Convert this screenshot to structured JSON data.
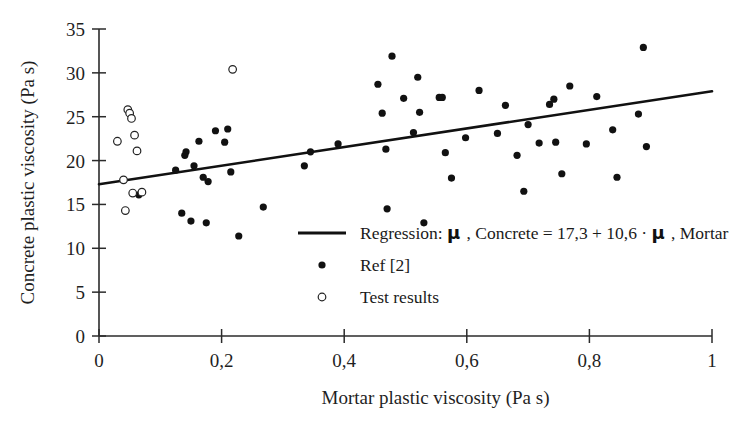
{
  "chart_data": {
    "type": "scatter",
    "title": "",
    "xlabel": "Mortar plastic viscosity (Pa s)",
    "ylabel": "Concrete plastic viscosity (Pa s)",
    "xlim": [
      0,
      1
    ],
    "ylim": [
      0,
      35
    ],
    "xticks": [
      "0",
      "0,2",
      "0,4",
      "0,6",
      "0,8",
      "1"
    ],
    "xtick_values": [
      0,
      0.2,
      0.4,
      0.6,
      0.8,
      1
    ],
    "yticks": [
      "0",
      "5",
      "10",
      "15",
      "20",
      "25",
      "30",
      "35"
    ],
    "ytick_values": [
      0,
      5,
      10,
      15,
      20,
      25,
      30,
      35
    ],
    "grid": false,
    "legend_position": "center",
    "series": [
      {
        "name": "Regression",
        "kind": "line",
        "equation_text": "Regression:  μ , Concrete = 17,3 + 10,6 · μ , Mortar",
        "intercept": 17.3,
        "slope": 10.6,
        "x_from": 0.0,
        "x_to": 1.0,
        "y_from": 17.3,
        "y_to": 27.9
      },
      {
        "name": "Ref [2]",
        "kind": "scatter",
        "marker": "filled-circle",
        "points": [
          [
            0.065,
            16.1
          ],
          [
            0.125,
            18.9
          ],
          [
            0.135,
            14.0
          ],
          [
            0.14,
            20.6
          ],
          [
            0.142,
            21.0
          ],
          [
            0.15,
            13.1
          ],
          [
            0.155,
            19.4
          ],
          [
            0.163,
            22.2
          ],
          [
            0.17,
            18.1
          ],
          [
            0.175,
            12.9
          ],
          [
            0.178,
            17.6
          ],
          [
            0.19,
            23.4
          ],
          [
            0.205,
            22.1
          ],
          [
            0.21,
            23.6
          ],
          [
            0.215,
            18.7
          ],
          [
            0.228,
            11.4
          ],
          [
            0.268,
            14.7
          ],
          [
            0.335,
            19.4
          ],
          [
            0.345,
            21.0
          ],
          [
            0.39,
            21.9
          ],
          [
            0.455,
            28.7
          ],
          [
            0.462,
            25.4
          ],
          [
            0.468,
            21.3
          ],
          [
            0.47,
            14.5
          ],
          [
            0.478,
            31.9
          ],
          [
            0.497,
            27.1
          ],
          [
            0.513,
            23.2
          ],
          [
            0.52,
            29.5
          ],
          [
            0.523,
            25.5
          ],
          [
            0.53,
            12.9
          ],
          [
            0.555,
            27.2
          ],
          [
            0.56,
            27.2
          ],
          [
            0.565,
            20.9
          ],
          [
            0.575,
            18.0
          ],
          [
            0.598,
            22.6
          ],
          [
            0.62,
            28.0
          ],
          [
            0.65,
            23.1
          ],
          [
            0.663,
            26.3
          ],
          [
            0.682,
            20.6
          ],
          [
            0.693,
            16.5
          ],
          [
            0.7,
            24.1
          ],
          [
            0.718,
            22.0
          ],
          [
            0.735,
            26.4
          ],
          [
            0.742,
            27.0
          ],
          [
            0.745,
            22.1
          ],
          [
            0.755,
            18.5
          ],
          [
            0.768,
            28.5
          ],
          [
            0.795,
            21.9
          ],
          [
            0.812,
            27.3
          ],
          [
            0.838,
            23.5
          ],
          [
            0.845,
            18.1
          ],
          [
            0.88,
            25.3
          ],
          [
            0.888,
            32.9
          ],
          [
            0.893,
            21.6
          ]
        ]
      },
      {
        "name": "Test results",
        "kind": "scatter",
        "marker": "open-circle",
        "points": [
          [
            0.03,
            22.2
          ],
          [
            0.04,
            17.8
          ],
          [
            0.043,
            14.3
          ],
          [
            0.047,
            25.8
          ],
          [
            0.05,
            25.4
          ],
          [
            0.053,
            24.8
          ],
          [
            0.055,
            16.3
          ],
          [
            0.058,
            22.9
          ],
          [
            0.062,
            21.1
          ],
          [
            0.07,
            16.4
          ],
          [
            0.218,
            30.4
          ]
        ]
      }
    ],
    "legend_entries": [
      {
        "marker": "line",
        "label": "Regression:  μ , Concrete = 17,3 + 10,6 · μ , Mortar"
      },
      {
        "marker": "filled-circle",
        "label": "Ref [2]"
      },
      {
        "marker": "open-circle",
        "label": "Test results"
      }
    ],
    "colors": {
      "axis": "#2b2b2b",
      "regression": "#111111",
      "ref_marker": "#111111",
      "test_marker_stroke": "#222222",
      "test_marker_fill": "#ffffff",
      "background": "#ffffff"
    }
  },
  "legend": {
    "regression_prefix": "Regression:",
    "mu_symbol": "μ",
    "regression_part1": ", Concrete = 17,3 + 10,6 ·",
    "regression_part2": ", Mortar",
    "ref_label": "Ref [2]",
    "test_label": "Test results"
  },
  "axes": {
    "x_title": "Mortar plastic viscosity (Pa s)",
    "y_title": "Concrete plastic viscosity (Pa s)"
  }
}
